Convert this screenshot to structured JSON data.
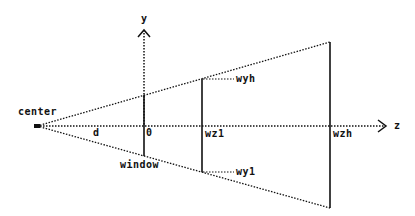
{
  "diagram": {
    "labels": {
      "y_axis": "y",
      "z_axis": "z",
      "center": "center",
      "distance": "d",
      "origin": "0",
      "window": "window",
      "wz1": "wz1",
      "wzh": "wzh",
      "wyh": "wyh",
      "wy1": "wy1"
    },
    "colors": {
      "line": "#111111",
      "background": "#ffffff"
    }
  }
}
